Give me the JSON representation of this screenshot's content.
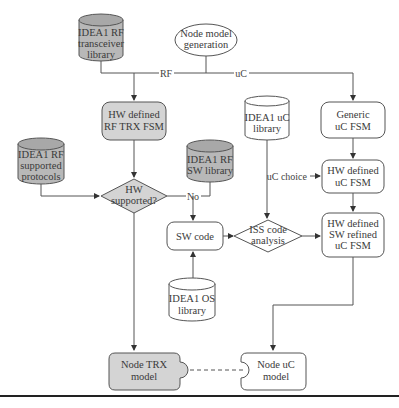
{
  "diagram": {
    "nodes": {
      "rf_transceiver_library": {
        "lines": [
          "IDEA1 RF",
          "transceiver",
          "library"
        ],
        "shape": "cylinder",
        "fill": "#b8b8b8"
      },
      "node_model_generation": {
        "lines": [
          "Node model",
          "generation"
        ],
        "shape": "ellipse",
        "fill": "#ffffff"
      },
      "hw_defined_rf_trx_fsm": {
        "lines": [
          "HW defined",
          "RF TRX FSM"
        ],
        "shape": "rounded-rect",
        "fill": "#d4d4d4"
      },
      "generic_uc_fsm": {
        "lines": [
          "Generic",
          "uC FSM"
        ],
        "shape": "rounded-rect",
        "fill": "#ffffff"
      },
      "uc_library": {
        "lines": [
          "IDEA1 uC",
          "library"
        ],
        "shape": "cylinder",
        "fill": "#ffffff"
      },
      "rf_supported_protocols": {
        "lines": [
          "IDEA1 RF",
          "supported",
          "protocols"
        ],
        "shape": "cylinder",
        "fill": "#b8b8b8"
      },
      "rf_sw_library": {
        "lines": [
          "IDEA1 RF",
          "SW library"
        ],
        "shape": "cylinder",
        "fill": "#b8b8b8"
      },
      "hw_supported": {
        "lines": [
          "HW",
          "supported?"
        ],
        "shape": "diamond",
        "fill": "#d4d4d4"
      },
      "hw_defined_uc_fsm": {
        "lines": [
          "HW defined",
          "uC FSM"
        ],
        "shape": "rounded-rect",
        "fill": "#ffffff"
      },
      "sw_code": {
        "lines": [
          "SW code"
        ],
        "shape": "rounded-rect",
        "fill": "#ffffff"
      },
      "iss_code_analysis": {
        "lines": [
          "ISS code",
          "analysis"
        ],
        "shape": "diamond",
        "fill": "#ffffff"
      },
      "hw_sw_refined_uc_fsm": {
        "lines": [
          "HW defined",
          "SW refined",
          "uC FSM"
        ],
        "shape": "rounded-rect",
        "fill": "#ffffff"
      },
      "os_library": {
        "lines": [
          "IDEA1 OS",
          "library"
        ],
        "shape": "cylinder",
        "fill": "#ffffff"
      },
      "node_trx_model": {
        "lines": [
          "Node TRX",
          "model"
        ],
        "shape": "puzzle-tab",
        "fill": "#d4d4d4"
      },
      "node_uc_model": {
        "lines": [
          "Node uC",
          "model"
        ],
        "shape": "puzzle-notch",
        "fill": "#ffffff"
      }
    },
    "edge_labels": {
      "rf": "RF",
      "uc": "uC",
      "no": "No",
      "uc_choice": "uC choice"
    },
    "colors": {
      "stroke": "#4a4a4a",
      "gray_fill": "#b8b8b8",
      "light_gray_fill": "#d4d4d4",
      "text": "#3a3a3a",
      "rule": "#222222"
    }
  }
}
